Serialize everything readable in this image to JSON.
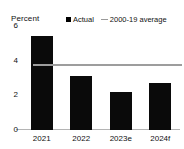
{
  "chart_data": {
    "type": "bar",
    "title": "",
    "subtitle": "",
    "xlabel": "",
    "ylabel": "Percent",
    "categories": [
      "2021",
      "2022",
      "2023e",
      "2024f"
    ],
    "series": [
      {
        "name": "Actual",
        "type": "bar",
        "color": "#0a0a0a",
        "values": [
          5.4,
          3.1,
          2.2,
          2.7
        ]
      },
      {
        "name": "2000-19 average",
        "type": "line",
        "color": "#9d9d9d",
        "value": 3.7
      }
    ],
    "ylim": [
      0,
      6
    ],
    "yticks": [
      0,
      2,
      4,
      6
    ],
    "ytick_labels": [
      "0",
      "2",
      "4",
      "6"
    ],
    "grid": false,
    "legend_position": "top-right",
    "legend_entries": [
      {
        "label": "Actual",
        "marker": "square-swatch-icon",
        "color": "#0a0a0a"
      },
      {
        "label": "2000-19 average",
        "marker": "line-swatch-icon",
        "color": "#9d9d9d"
      }
    ]
  },
  "axis": {
    "unit_label": "Percent"
  },
  "colors": {
    "bar": "#0a0a0a",
    "average_line": "#9d9d9d",
    "axis": "#b4b4b4",
    "text": "#111111",
    "background": "#ffffff"
  }
}
